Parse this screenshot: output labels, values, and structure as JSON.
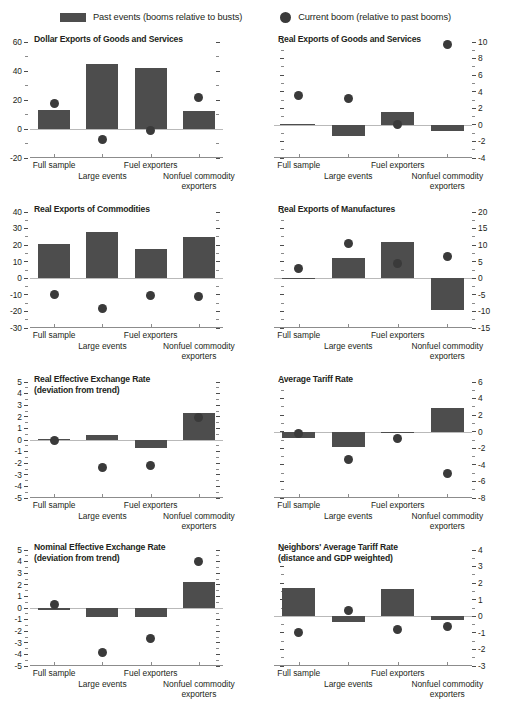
{
  "legend": {
    "items": [
      {
        "marker": "bar-swatch",
        "label": "Past events (booms relative to busts)"
      },
      {
        "marker": "dot-swatch",
        "label": "Current boom (relative to past booms)"
      }
    ]
  },
  "colors": {
    "bar": "#4d4d4d",
    "dot": "#3a3a3a",
    "axis": "#8c8c8c",
    "zero_line": "#b9b9b9",
    "text": "#231f20",
    "background": "#ffffff"
  },
  "categories": [
    "Full sample",
    "Large events",
    "Fuel exporters",
    "Nonfuel commodity exporters"
  ],
  "category_rows": [
    0,
    1,
    0,
    1
  ],
  "chart_data": [
    {
      "type": "bar",
      "title": "Dollar Exports of Goods and Services",
      "axis_side": "left",
      "categories": [
        "Full sample",
        "Large events",
        "Fuel exporters",
        "Nonfuel commodity exporters"
      ],
      "series": [
        {
          "name": "Past events (booms relative to busts)",
          "type": "bar",
          "values": [
            13,
            44.5,
            42,
            12.5
          ]
        },
        {
          "name": "Current boom (relative to past booms)",
          "type": "scatter",
          "values": [
            17.5,
            -7.5,
            -1,
            22
          ]
        }
      ],
      "ylim": [
        -20,
        60
      ],
      "yticks": [
        -20,
        0,
        20,
        40,
        60
      ],
      "yticklabels": [
        "-20",
        "0",
        "20",
        "40",
        "60"
      ],
      "minor_tick_step": 10,
      "xlabel": "",
      "ylabel": "",
      "grid": false
    },
    {
      "type": "bar",
      "title": "Real Exports of Goods and Services",
      "axis_side": "right",
      "categories": [
        "Full sample",
        "Large events",
        "Fuel exporters",
        "Nonfuel commodity exporters"
      ],
      "series": [
        {
          "name": "Past events (booms relative to busts)",
          "type": "bar",
          "values": [
            0.05,
            -1.4,
            1.5,
            -0.7
          ]
        },
        {
          "name": "Current boom (relative to past booms)",
          "type": "scatter",
          "values": [
            3.6,
            3.2,
            0.0,
            9.7
          ]
        }
      ],
      "ylim": [
        -4,
        10
      ],
      "yticks": [
        -4,
        -2,
        0,
        2,
        4,
        6,
        8,
        10
      ],
      "yticklabels": [
        "-4",
        "-2",
        "0",
        "2",
        "4",
        "6",
        "8",
        "10"
      ],
      "minor_tick_step": 1,
      "xlabel": "",
      "ylabel": "",
      "grid": false
    },
    {
      "type": "bar",
      "title": "Real Exports of Commodities",
      "axis_side": "left",
      "categories": [
        "Full sample",
        "Large events",
        "Fuel exporters",
        "Nonfuel commodity exporters"
      ],
      "series": [
        {
          "name": "Past events (booms relative to busts)",
          "type": "bar",
          "values": [
            20.5,
            28,
            17.5,
            25
          ]
        },
        {
          "name": "Current boom (relative to past booms)",
          "type": "scatter",
          "values": [
            -9.5,
            -18.5,
            -10.5,
            -11
          ]
        }
      ],
      "ylim": [
        -30,
        40
      ],
      "yticks": [
        -30,
        -20,
        -10,
        0,
        10,
        20,
        30,
        40
      ],
      "yticklabels": [
        "-30",
        "-20",
        "-10",
        "0",
        "10",
        "20",
        "30",
        "40"
      ],
      "minor_tick_step": 5,
      "xlabel": "",
      "ylabel": "",
      "grid": false
    },
    {
      "type": "bar",
      "title": "Real Exports of Manufactures",
      "axis_side": "right",
      "categories": [
        "Full sample",
        "Large events",
        "Fuel exporters",
        "Nonfuel commodity exporters"
      ],
      "series": [
        {
          "name": "Past events (booms relative to busts)",
          "type": "bar",
          "values": [
            0.1,
            6,
            11,
            -9.5
          ]
        },
        {
          "name": "Current boom (relative to past booms)",
          "type": "scatter",
          "values": [
            3,
            10.5,
            4.5,
            6.5
          ]
        }
      ],
      "ylim": [
        -15,
        20
      ],
      "yticks": [
        -15,
        -10,
        -5,
        0,
        5,
        10,
        15,
        20
      ],
      "yticklabels": [
        "-15",
        "-10",
        "-5",
        "0",
        "5",
        "10",
        "15",
        "20"
      ],
      "minor_tick_step": 2.5,
      "xlabel": "",
      "ylabel": "",
      "grid": false
    },
    {
      "type": "bar",
      "title": "Real Effective Exchange Rate",
      "subtitle": "(deviation from trend)",
      "axis_side": "left",
      "categories": [
        "Full sample",
        "Large events",
        "Fuel exporters",
        "Nonfuel commodity exporters"
      ],
      "series": [
        {
          "name": "Past events (booms relative to busts)",
          "type": "bar",
          "values": [
            0.1,
            0.45,
            -0.7,
            2.3
          ]
        },
        {
          "name": "Current boom (relative to past booms)",
          "type": "scatter",
          "values": [
            0.0,
            -2.4,
            -2.2,
            1.9
          ]
        }
      ],
      "ylim": [
        -5,
        5
      ],
      "yticks": [
        -5,
        -4,
        -3,
        -2,
        -1,
        0,
        1,
        2,
        3,
        4,
        5
      ],
      "yticklabels": [
        "-5",
        "-4",
        "-3",
        "-2",
        "-1",
        "0",
        "1",
        "2",
        "3",
        "4",
        "5"
      ],
      "minor_tick_step": 0.5,
      "xlabel": "",
      "ylabel": "",
      "grid": false
    },
    {
      "type": "bar",
      "title": "Average Tariff Rate",
      "axis_side": "right",
      "categories": [
        "Full sample",
        "Large events",
        "Fuel exporters",
        "Nonfuel commodity exporters"
      ],
      "series": [
        {
          "name": "Past events (booms relative to busts)",
          "type": "bar",
          "values": [
            -0.7,
            -1.9,
            -0.15,
            2.9
          ]
        },
        {
          "name": "Current boom (relative to past booms)",
          "type": "scatter",
          "values": [
            -0.25,
            -3.4,
            -0.85,
            -5.0
          ]
        }
      ],
      "ylim": [
        -8,
        6
      ],
      "yticks": [
        -8,
        -6,
        -4,
        -2,
        0,
        2,
        4,
        6
      ],
      "yticklabels": [
        "-8",
        "-6",
        "-4",
        "-2",
        "0",
        "2",
        "4",
        "6"
      ],
      "minor_tick_step": 1,
      "xlabel": "",
      "ylabel": "",
      "grid": false
    },
    {
      "type": "bar",
      "title": "Nominal Effective Exchange Rate",
      "subtitle": "(deviation from trend)",
      "axis_side": "left",
      "categories": [
        "Full sample",
        "Large events",
        "Fuel exporters",
        "Nonfuel commodity exporters"
      ],
      "series": [
        {
          "name": "Past events (booms relative to busts)",
          "type": "bar",
          "values": [
            -0.15,
            -0.75,
            -0.8,
            2.2
          ]
        },
        {
          "name": "Current boom (relative to past booms)",
          "type": "scatter",
          "values": [
            0.3,
            -3.8,
            -2.6,
            4.0
          ]
        }
      ],
      "ylim": [
        -5,
        5
      ],
      "yticks": [
        -5,
        -4,
        -3,
        -2,
        -1,
        0,
        1,
        2,
        3,
        4,
        5
      ],
      "yticklabels": [
        "-5",
        "-4",
        "-3",
        "-2",
        "-1",
        "0",
        "1",
        "2",
        "3",
        "4",
        "5"
      ],
      "minor_tick_step": 0.5,
      "xlabel": "",
      "ylabel": "",
      "grid": false
    },
    {
      "type": "bar",
      "title": "Neighbors' Average Tariff Rate",
      "subtitle": "(distance and GDP weighted)",
      "axis_side": "right",
      "categories": [
        "Full sample",
        "Large events",
        "Fuel exporters",
        "Nonfuel commodity exporters"
      ],
      "series": [
        {
          "name": "Past events (booms relative to busts)",
          "type": "bar",
          "values": [
            1.7,
            -0.35,
            1.65,
            -0.2
          ]
        },
        {
          "name": "Current boom (relative to past booms)",
          "type": "scatter",
          "values": [
            -0.95,
            0.35,
            -0.8,
            -0.6
          ]
        }
      ],
      "ylim": [
        -3,
        4
      ],
      "yticks": [
        -3,
        -2,
        -1,
        0,
        1,
        2,
        3,
        4
      ],
      "yticklabels": [
        "-3",
        "-2",
        "-1",
        "0",
        "1",
        "2",
        "3",
        "4"
      ],
      "minor_tick_step": 0.5,
      "xlabel": "",
      "ylabel": "",
      "grid": false
    }
  ]
}
